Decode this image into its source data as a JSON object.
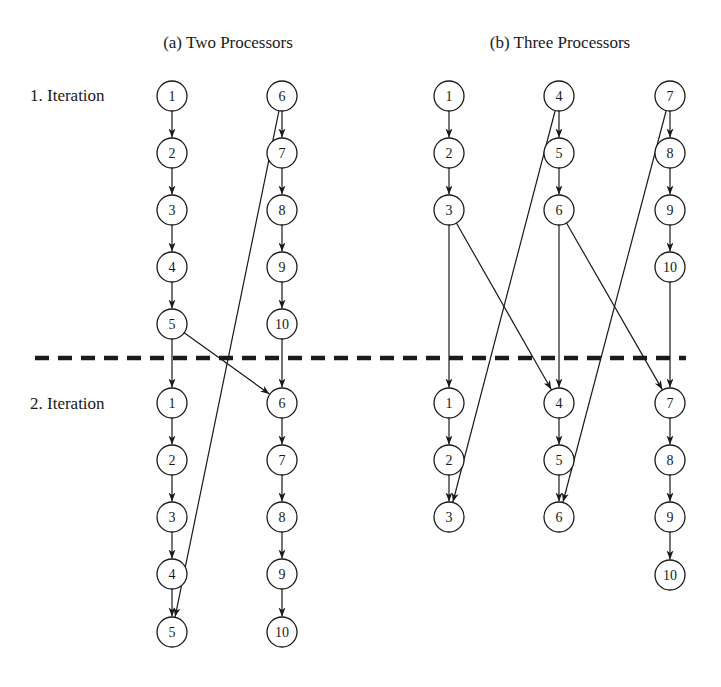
{
  "panels": [
    {
      "id": "a",
      "title": "(a) Two Processors",
      "title_x": 228,
      "title_y": 48
    },
    {
      "id": "b",
      "title": "(b) Three Processors",
      "title_x": 560,
      "title_y": 48
    }
  ],
  "row_labels": [
    {
      "text": "1. Iteration",
      "x": 30,
      "y": 101
    },
    {
      "text": "2. Iteration",
      "x": 30,
      "y": 409
    }
  ],
  "divider": {
    "x1": 35,
    "x2": 686,
    "y": 358
  },
  "node_radius": 15,
  "nodes": [
    {
      "id": "a1-1",
      "label": "1",
      "x": 172,
      "y": 96
    },
    {
      "id": "a1-2",
      "label": "2",
      "x": 172,
      "y": 153
    },
    {
      "id": "a1-3",
      "label": "3",
      "x": 172,
      "y": 210
    },
    {
      "id": "a1-4",
      "label": "4",
      "x": 172,
      "y": 267
    },
    {
      "id": "a1-5",
      "label": "5",
      "x": 172,
      "y": 324
    },
    {
      "id": "a1-6",
      "label": "6",
      "x": 282,
      "y": 96
    },
    {
      "id": "a1-7",
      "label": "7",
      "x": 282,
      "y": 153
    },
    {
      "id": "a1-8",
      "label": "8",
      "x": 282,
      "y": 210
    },
    {
      "id": "a1-9",
      "label": "9",
      "x": 282,
      "y": 267
    },
    {
      "id": "a1-10",
      "label": "10",
      "x": 282,
      "y": 324
    },
    {
      "id": "a2-1",
      "label": "1",
      "x": 172,
      "y": 403
    },
    {
      "id": "a2-2",
      "label": "2",
      "x": 172,
      "y": 460
    },
    {
      "id": "a2-3",
      "label": "3",
      "x": 172,
      "y": 517
    },
    {
      "id": "a2-4",
      "label": "4",
      "x": 172,
      "y": 574
    },
    {
      "id": "a2-5",
      "label": "5",
      "x": 172,
      "y": 632
    },
    {
      "id": "a2-6",
      "label": "6",
      "x": 282,
      "y": 403
    },
    {
      "id": "a2-7",
      "label": "7",
      "x": 282,
      "y": 460
    },
    {
      "id": "a2-8",
      "label": "8",
      "x": 282,
      "y": 517
    },
    {
      "id": "a2-9",
      "label": "9",
      "x": 282,
      "y": 574
    },
    {
      "id": "a2-10",
      "label": "10",
      "x": 282,
      "y": 632
    },
    {
      "id": "b1-1",
      "label": "1",
      "x": 449,
      "y": 96
    },
    {
      "id": "b1-2",
      "label": "2",
      "x": 449,
      "y": 153
    },
    {
      "id": "b1-3",
      "label": "3",
      "x": 449,
      "y": 210
    },
    {
      "id": "b1-4",
      "label": "4",
      "x": 559,
      "y": 96
    },
    {
      "id": "b1-5",
      "label": "5",
      "x": 559,
      "y": 153
    },
    {
      "id": "b1-6",
      "label": "6",
      "x": 559,
      "y": 210
    },
    {
      "id": "b1-7",
      "label": "7",
      "x": 670,
      "y": 96
    },
    {
      "id": "b1-8",
      "label": "8",
      "x": 670,
      "y": 153
    },
    {
      "id": "b1-9",
      "label": "9",
      "x": 670,
      "y": 210
    },
    {
      "id": "b1-10",
      "label": "10",
      "x": 670,
      "y": 267
    },
    {
      "id": "b2-1",
      "label": "1",
      "x": 449,
      "y": 403
    },
    {
      "id": "b2-2",
      "label": "2",
      "x": 449,
      "y": 460
    },
    {
      "id": "b2-3",
      "label": "3",
      "x": 449,
      "y": 517
    },
    {
      "id": "b2-4",
      "label": "4",
      "x": 559,
      "y": 403
    },
    {
      "id": "b2-5",
      "label": "5",
      "x": 559,
      "y": 460
    },
    {
      "id": "b2-6",
      "label": "6",
      "x": 559,
      "y": 517
    },
    {
      "id": "b2-7",
      "label": "7",
      "x": 670,
      "y": 403
    },
    {
      "id": "b2-8",
      "label": "8",
      "x": 670,
      "y": 460
    },
    {
      "id": "b2-9",
      "label": "9",
      "x": 670,
      "y": 517
    },
    {
      "id": "b2-10",
      "label": "10",
      "x": 670,
      "y": 575
    }
  ],
  "edges": [
    {
      "from": "a1-1",
      "to": "a1-2"
    },
    {
      "from": "a1-2",
      "to": "a1-3"
    },
    {
      "from": "a1-3",
      "to": "a1-4"
    },
    {
      "from": "a1-4",
      "to": "a1-5"
    },
    {
      "from": "a1-5",
      "to": "a2-1"
    },
    {
      "from": "a1-5",
      "to": "a2-6"
    },
    {
      "from": "a1-6",
      "to": "a1-7"
    },
    {
      "from": "a1-7",
      "to": "a1-8"
    },
    {
      "from": "a1-8",
      "to": "a1-9"
    },
    {
      "from": "a1-9",
      "to": "a1-10"
    },
    {
      "from": "a1-10",
      "to": "a2-6"
    },
    {
      "from": "a1-6",
      "to": "a2-5"
    },
    {
      "from": "a2-1",
      "to": "a2-2"
    },
    {
      "from": "a2-2",
      "to": "a2-3"
    },
    {
      "from": "a2-3",
      "to": "a2-4"
    },
    {
      "from": "a2-4",
      "to": "a2-5"
    },
    {
      "from": "a2-6",
      "to": "a2-7"
    },
    {
      "from": "a2-7",
      "to": "a2-8"
    },
    {
      "from": "a2-8",
      "to": "a2-9"
    },
    {
      "from": "a2-9",
      "to": "a2-10"
    },
    {
      "from": "b1-1",
      "to": "b1-2"
    },
    {
      "from": "b1-2",
      "to": "b1-3"
    },
    {
      "from": "b1-3",
      "to": "b2-1"
    },
    {
      "from": "b1-3",
      "to": "b2-4"
    },
    {
      "from": "b1-4",
      "to": "b1-5"
    },
    {
      "from": "b1-5",
      "to": "b1-6"
    },
    {
      "from": "b1-6",
      "to": "b2-4"
    },
    {
      "from": "b1-6",
      "to": "b2-7"
    },
    {
      "from": "b1-4",
      "to": "b2-3"
    },
    {
      "from": "b1-7",
      "to": "b1-8"
    },
    {
      "from": "b1-8",
      "to": "b1-9"
    },
    {
      "from": "b1-9",
      "to": "b1-10"
    },
    {
      "from": "b1-10",
      "to": "b2-7"
    },
    {
      "from": "b1-7",
      "to": "b2-6"
    },
    {
      "from": "b2-1",
      "to": "b2-2"
    },
    {
      "from": "b2-2",
      "to": "b2-3"
    },
    {
      "from": "b2-4",
      "to": "b2-5"
    },
    {
      "from": "b2-5",
      "to": "b2-6"
    },
    {
      "from": "b2-7",
      "to": "b2-8"
    },
    {
      "from": "b2-8",
      "to": "b2-9"
    },
    {
      "from": "b2-9",
      "to": "b2-10"
    }
  ]
}
